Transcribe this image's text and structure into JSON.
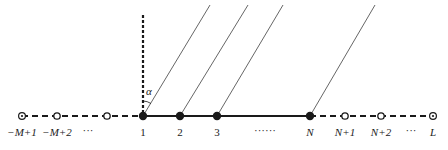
{
  "diagram": {
    "type": "lattice-with-incident-rays",
    "axis": {
      "y": 116,
      "x_start": 22,
      "x_end": 433
    },
    "angle_label": "α",
    "vertical_line": {
      "x": 143,
      "y_top": 15,
      "y_bottom": 116,
      "style": "dashed"
    },
    "nodes": [
      {
        "id": "n-m1",
        "x": 22,
        "kind": "circle-dot",
        "label": "−M+1",
        "italic": true
      },
      {
        "id": "n-m2",
        "x": 57,
        "kind": "open",
        "label": "−M+2",
        "italic": true
      },
      {
        "id": "ellipsis-left",
        "x": 88,
        "kind": "none",
        "label": "···",
        "italic": false
      },
      {
        "id": "n-0",
        "x": 107,
        "kind": "open",
        "label": "",
        "italic": false
      },
      {
        "id": "n-1",
        "x": 143,
        "kind": "filled",
        "label": "1",
        "italic": false
      },
      {
        "id": "n-2",
        "x": 180,
        "kind": "filled",
        "label": "2",
        "italic": false
      },
      {
        "id": "n-3",
        "x": 217,
        "kind": "filled",
        "label": "3",
        "italic": false
      },
      {
        "id": "ellipsis-mid",
        "x": 265,
        "kind": "none",
        "label": "······",
        "italic": false
      },
      {
        "id": "n-N",
        "x": 310,
        "kind": "filled",
        "label": "N",
        "italic": true
      },
      {
        "id": "n-N1",
        "x": 345,
        "kind": "open",
        "label": "N+1",
        "italic": true
      },
      {
        "id": "n-N2",
        "x": 381,
        "kind": "open",
        "label": "N+2",
        "italic": true
      },
      {
        "id": "ellipsis-right",
        "x": 411,
        "kind": "none",
        "label": "···",
        "italic": false
      },
      {
        "id": "n-L",
        "x": 433,
        "kind": "circle-dot",
        "label": "L",
        "italic": true
      }
    ],
    "rays": [
      {
        "from": [
          210,
          5
        ],
        "to": [
          143,
          116
        ]
      },
      {
        "from": [
          248,
          5
        ],
        "to": [
          180,
          116
        ]
      },
      {
        "from": [
          283,
          5
        ],
        "to": [
          217,
          116
        ]
      },
      {
        "from": [
          375,
          5
        ],
        "to": [
          310,
          116
        ]
      }
    ],
    "segments": {
      "left_dashed": {
        "x1": 22,
        "x2": 143
      },
      "solid": {
        "x1": 143,
        "x2": 310
      },
      "right_dashed": {
        "x1": 310,
        "x2": 433
      }
    },
    "colors": {
      "stroke": "#1a1a1a",
      "ray": "#555555",
      "background": "#ffffff"
    }
  }
}
